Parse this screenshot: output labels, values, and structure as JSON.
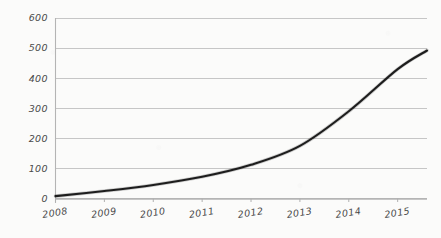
{
  "chart_data": {
    "type": "line",
    "title": "",
    "subtitle": "",
    "xlabel": "",
    "ylabel": "",
    "style": "hand-drawn sketch",
    "grid": true,
    "legend": null,
    "legend_position": "none",
    "xlim": [
      2008,
      2015.6
    ],
    "ylim": [
      0,
      600
    ],
    "x_tick_labels": [
      "2008",
      "2009",
      "2010",
      "2011",
      "2012",
      "2013",
      "2014",
      "2015"
    ],
    "y_tick_labels": [
      "0",
      "100",
      "200",
      "300",
      "400",
      "500",
      "600"
    ],
    "y_ticks": [
      0,
      100,
      200,
      300,
      400,
      500,
      600
    ],
    "x": [
      2008,
      2009,
      2010,
      2011,
      2012,
      2013,
      2014,
      2015,
      2015.6
    ],
    "series": [
      {
        "name": "growth",
        "color": "#1d1d1d",
        "values": [
          8,
          25,
          45,
          72,
          112,
          175,
          290,
          430,
          492
        ]
      }
    ]
  },
  "axes": {
    "y_axis_name": "value-axis",
    "x_axis_name": "year-axis"
  },
  "colors": {
    "background": "#fbfbfa",
    "gridline": "#c6c6c6",
    "axis": "#b4b4b4",
    "line": "#1d1d1d",
    "label": "#4a4a4a"
  }
}
